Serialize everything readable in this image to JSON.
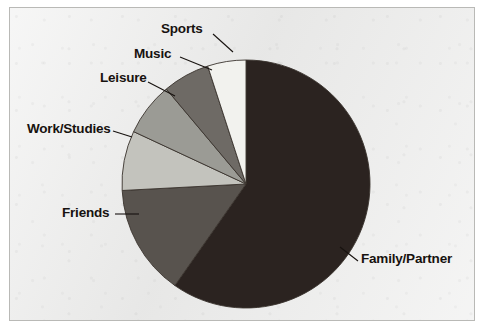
{
  "figure": {
    "background_color": "#ececeb",
    "border_color": "#b9b9b6",
    "text_color": "#17120f"
  },
  "chart_data": {
    "type": "pie",
    "title": "",
    "subtitle": "",
    "xlabel": "",
    "ylabel": "",
    "legend_position": "none",
    "grid": false,
    "labels_position": "outside-with-leader-lines",
    "start_angle_deg": 90,
    "direction": "clockwise",
    "center": {
      "x": 246,
      "y": 184
    },
    "radius": 124,
    "categories": [
      "Family/Partner",
      "Friends",
      "Work/Studies",
      "Leisure",
      "Music",
      "Sports"
    ],
    "values": [
      59.7,
      14.4,
      7.8,
      6.9,
      6.1,
      5.1
    ],
    "angles_deg": [
      215,
      52,
      28,
      25,
      22,
      18
    ],
    "colors": [
      "#2b2320",
      "#58534e",
      "#c3c3bd",
      "#9b9b95",
      "#6e6a65",
      "#f2f2ee"
    ],
    "slices": [
      {
        "label": "Family/Partner",
        "value": 59.7,
        "angle_deg": 215,
        "color": "#2b2320"
      },
      {
        "label": "Friends",
        "value": 14.4,
        "angle_deg": 52,
        "color": "#58534e"
      },
      {
        "label": "Work/Studies",
        "value": 7.8,
        "angle_deg": 28,
        "color": "#c3c3bd"
      },
      {
        "label": "Leisure",
        "value": 6.9,
        "angle_deg": 25,
        "color": "#9b9b95"
      },
      {
        "label": "Music",
        "value": 6.1,
        "angle_deg": 22,
        "color": "#6e6a65"
      },
      {
        "label": "Sports",
        "value": 5.1,
        "angle_deg": 18,
        "color": "#f2f2ee"
      }
    ]
  },
  "labels": {
    "sports": "Sports",
    "music": "Music",
    "leisure": "Leisure",
    "work_studies": "Work/Studies",
    "friends": "Friends",
    "family_partner": "Family/Partner"
  }
}
